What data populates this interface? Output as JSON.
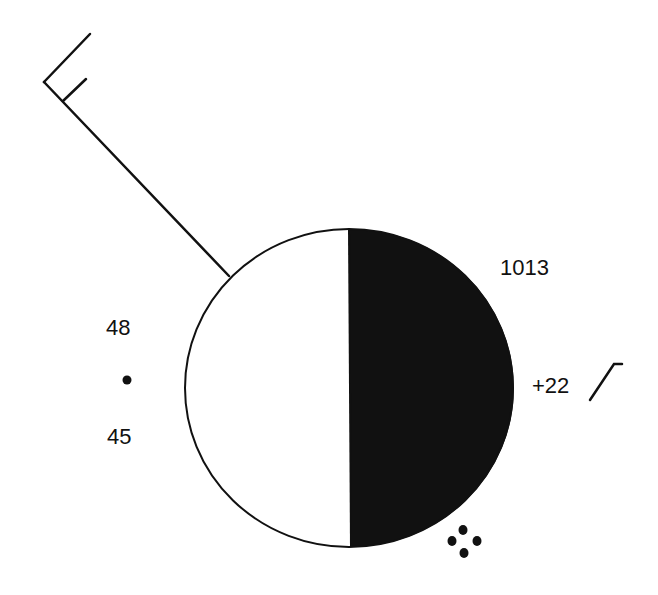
{
  "diagram": {
    "type": "weather-station-model",
    "pressure": "1013",
    "pressure_tendency": "+22",
    "pressure_tendency_symbol": "rising-then-steady",
    "temperature": "48",
    "dew_point": "45",
    "present_weather": "moderate-rain",
    "sky_cover": "half-covered",
    "wind": {
      "direction": "northwest",
      "barbs": [
        "full",
        "half"
      ],
      "speed_knots": 15
    },
    "colors": {
      "ink": "#111111",
      "background": "#ffffff"
    }
  }
}
